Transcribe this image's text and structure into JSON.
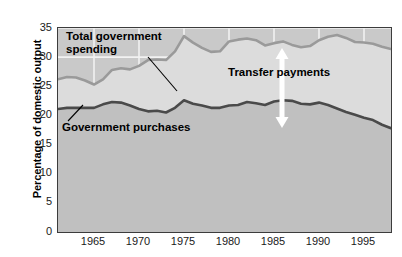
{
  "chart_data": {
    "type": "line",
    "title": "",
    "xlabel": "",
    "ylabel": "Percentage of domestic output",
    "xlim": [
      1961,
      1998
    ],
    "ylim": [
      0,
      35
    ],
    "grid": true,
    "legend_position": "inline-annotations",
    "yticks": [
      0,
      5,
      10,
      15,
      20,
      25,
      30,
      35
    ],
    "ytick_labels": [
      "0",
      "5",
      "10",
      "15",
      "20",
      "25",
      "30",
      "35"
    ],
    "xticks": [
      1965,
      1970,
      1975,
      1980,
      1985,
      1990,
      1995
    ],
    "xtick_labels": [
      "1965",
      "1970",
      "1975",
      "1980",
      "1985",
      "1990",
      "1995"
    ],
    "x": [
      1961,
      1962,
      1963,
      1964,
      1965,
      1966,
      1967,
      1968,
      1969,
      1970,
      1971,
      1972,
      1973,
      1974,
      1975,
      1976,
      1977,
      1978,
      1979,
      1980,
      1981,
      1982,
      1983,
      1984,
      1985,
      1986,
      1987,
      1988,
      1989,
      1990,
      1991,
      1992,
      1993,
      1994,
      1995,
      1996,
      1997,
      1998
    ],
    "series": [
      {
        "name": "Total government spending",
        "color": "#9a9a9a",
        "fill_color": "#dcdcdc",
        "values": [
          26.2,
          26.6,
          26.5,
          26.0,
          25.3,
          26.2,
          27.8,
          28.1,
          27.9,
          28.5,
          29.5,
          29.6,
          29.5,
          31.0,
          33.6,
          32.5,
          31.6,
          30.9,
          31.0,
          32.7,
          33.0,
          33.2,
          32.9,
          32.0,
          32.4,
          32.7,
          32.1,
          31.7,
          31.9,
          32.9,
          33.5,
          33.8,
          33.3,
          32.6,
          32.5,
          32.3,
          31.8,
          31.4
        ]
      },
      {
        "name": "Government purchases",
        "color": "#4a4a4a",
        "fill_color": "#c0c0c0",
        "values": [
          21.1,
          21.3,
          21.3,
          21.3,
          21.3,
          21.9,
          22.3,
          22.2,
          21.7,
          21.1,
          20.7,
          20.8,
          20.5,
          21.3,
          22.6,
          22.0,
          21.7,
          21.3,
          21.3,
          21.7,
          21.8,
          22.3,
          22.1,
          21.8,
          22.4,
          22.6,
          22.5,
          22.0,
          21.9,
          22.2,
          21.8,
          21.2,
          20.6,
          20.1,
          19.6,
          19.2,
          18.4,
          17.8
        ]
      }
    ],
    "annotations": [
      {
        "id": "total-spending",
        "text": "Total government\nspending",
        "leader_from": [
          147,
          56
        ],
        "leader_to": [
          176,
          90
        ]
      },
      {
        "id": "government-purchases",
        "text": "Government purchases",
        "leader_from": [
          67,
          120
        ],
        "leader_to": [
          82,
          104
        ]
      },
      {
        "id": "transfer-payments",
        "text": "Transfer payments",
        "arrow": "double-headed-vertical",
        "arrow_x": 281,
        "arrow_top": 47,
        "arrow_bottom": 127,
        "arrow_color": "#ffffff"
      }
    ]
  }
}
